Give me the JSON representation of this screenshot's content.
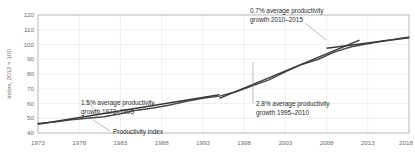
{
  "chart_data": {
    "type": "line",
    "title": "",
    "xlabel": "",
    "ylabel": "Index, 2012 = 100",
    "xlim": [
      1973,
      2018
    ],
    "ylim": [
      40,
      120
    ],
    "grid": true,
    "legend": "none",
    "xticks": [
      "1973",
      "1978",
      "1983",
      "1988",
      "1993",
      "1998",
      "2003",
      "2008",
      "2013",
      "2018"
    ],
    "yticks": [
      "40",
      "50",
      "60",
      "70",
      "80",
      "90",
      "100",
      "110",
      "120"
    ],
    "series": [
      {
        "name": "Productivity index",
        "x": [
          1973,
          1975,
          1977,
          1979,
          1981,
          1983,
          1985,
          1987,
          1989,
          1991,
          1993,
          1995,
          1997,
          1999,
          2001,
          2003,
          2005,
          2007,
          2009,
          2011,
          2013,
          2015,
          2016,
          2017,
          2018
        ],
        "values": [
          46.5,
          47.5,
          49.0,
          50.0,
          51.0,
          53.0,
          55.5,
          57.0,
          59.0,
          61.5,
          63.5,
          65.0,
          68.0,
          72.0,
          76.0,
          81.5,
          86.5,
          90.0,
          95.0,
          98.5,
          100.5,
          102.5,
          103.3,
          104.2,
          105.0
        ]
      }
    ],
    "trend_segments": [
      {
        "name": "1.5% average productivity growth 1973-1995",
        "x": [
          1973,
          1995
        ],
        "values": [
          46.0,
          66.0
        ]
      },
      {
        "name": "2.8% average productivity growth 1995-2010",
        "x": [
          1995,
          2012
        ],
        "values": [
          63.5,
          103.0
        ]
      },
      {
        "name": "0.7% average productivity growth 2010-2015",
        "x": [
          2008,
          2018
        ],
        "values": [
          97.5,
          104.5
        ]
      }
    ],
    "annotations": [
      {
        "id": "annot-1973-1995",
        "line1": "1.5% average productivity",
        "line2": "growth 1973–1995"
      },
      {
        "id": "annot-1995-2010",
        "line1": "2.8% average productivity",
        "line2": "growth 1995–2010"
      },
      {
        "id": "annot-2010-2015",
        "line1": "0.7% average productivity",
        "line2": "growth 2010–2015"
      },
      {
        "id": "annot-series-label",
        "line1": "Productivity index",
        "line2": ""
      }
    ],
    "colors": {
      "series": "#4a4a4a",
      "trend": "#3a3a3a",
      "grid": "#e9e9e9",
      "frame": "#b0b0b0",
      "tick_text": "#6e6e6e",
      "annotation_text": "#2b2b2b",
      "background": "#ffffff"
    }
  }
}
